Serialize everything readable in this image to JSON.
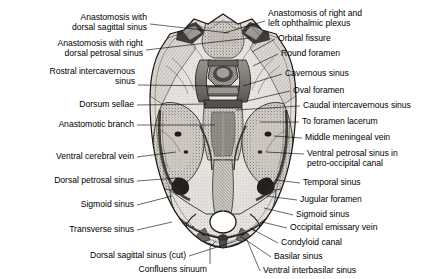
{
  "figure": {
    "illustration_name": "skull-base-venous-sinuses-illustration",
    "style": "grayscale pen-and-ink anatomical drawing",
    "background_color": "#ffffff",
    "ink_color": "#000000",
    "width": 446,
    "height": 279
  },
  "labels_left": [
    {
      "id": "anastomosis-dorsal-sagittal-sinus",
      "lines": [
        "Anastomosis with",
        "dorsal sagittal sinus"
      ],
      "x": 147,
      "y": 12,
      "tip_x": 229,
      "tip_y": 33
    },
    {
      "id": "anastomosis-right-dorsal-petrosal-sinus",
      "lines": [
        "Anastomosis with right",
        "dorsal petrosal sinus"
      ],
      "x": 143,
      "y": 38,
      "tip_x": 250,
      "tip_y": 38
    },
    {
      "id": "rostral-intercavernous-sinus",
      "lines": [
        "Rostral intercavernous",
        "sinus"
      ],
      "x": 135,
      "y": 66,
      "tip_x": 222,
      "tip_y": 86
    },
    {
      "id": "dorsum-sellae",
      "lines": [
        "Dorsum sellae"
      ],
      "x": 134,
      "y": 99,
      "tip_x": 207,
      "tip_y": 104
    },
    {
      "id": "anastomotic-branch",
      "lines": [
        "Anastomotic branch"
      ],
      "x": 134,
      "y": 119,
      "tip_x": 215,
      "tip_y": 125
    },
    {
      "id": "ventral-cerebral-vein",
      "lines": [
        "Ventral cerebral vein"
      ],
      "x": 134,
      "y": 151,
      "tip_x": 176,
      "tip_y": 152
    },
    {
      "id": "dorsal-petrosal-sinus",
      "lines": [
        "Dorsal petrosal sinus"
      ],
      "x": 134,
      "y": 175,
      "tip_x": 178,
      "tip_y": 178
    },
    {
      "id": "sigmoid-sinus-left",
      "lines": [
        "Sigmoid sinus"
      ],
      "x": 134,
      "y": 199,
      "tip_x": 172,
      "tip_y": 196
    },
    {
      "id": "transverse-sinus",
      "lines": [
        "Transverse sinus"
      ],
      "x": 134,
      "y": 224,
      "tip_x": 172,
      "tip_y": 222
    },
    {
      "id": "dorsal-sagittal-sinus-cut",
      "lines": [
        "Dorsal sagittal sinus (cut)"
      ],
      "x": 186,
      "y": 250,
      "tip_x": 236,
      "tip_y": 241
    },
    {
      "id": "confluens-sinuum",
      "lines": [
        "Confluens sinuum"
      ],
      "x": 207,
      "y": 264,
      "tip_x": 211,
      "tip_y": 240
    }
  ],
  "labels_right": [
    {
      "id": "anastomosis-right-left-ophthalmic-plexus",
      "lines": [
        "Anastomosis of right and",
        "left ophthalmic plexus"
      ],
      "x": 268,
      "y": 8,
      "tip_x": 224,
      "tip_y": 33
    },
    {
      "id": "orbital-fissure",
      "lines": [
        "Orbital fissure"
      ],
      "x": 278,
      "y": 33,
      "tip_x": 252,
      "tip_y": 52
    },
    {
      "id": "round-foramen",
      "lines": [
        "Round foramen"
      ],
      "x": 281,
      "y": 48,
      "tip_x": 253,
      "tip_y": 66
    },
    {
      "id": "cavernous-sinus",
      "lines": [
        "Cavernous sinus"
      ],
      "x": 285,
      "y": 68,
      "tip_x": 243,
      "tip_y": 86
    },
    {
      "id": "oval-foramen",
      "lines": [
        "Oval foramen"
      ],
      "x": 293,
      "y": 85,
      "tip_x": 247,
      "tip_y": 101
    },
    {
      "id": "caudal-intercavernous-sinus",
      "lines": [
        "Caudal intercavernous sinus"
      ],
      "x": 303,
      "y": 100,
      "tip_x": 236,
      "tip_y": 110
    },
    {
      "id": "to-foramen-lacerum",
      "lines": [
        "To foramen lacerum"
      ],
      "x": 302,
      "y": 116,
      "tip_x": 260,
      "tip_y": 122
    },
    {
      "id": "middle-meningeal-vein",
      "lines": [
        "Middle meningeal vein"
      ],
      "x": 305,
      "y": 132,
      "tip_x": 274,
      "tip_y": 136
    },
    {
      "id": "ventral-petrosal-sinus",
      "lines": [
        "Ventral petrosal sinus in",
        "petro-occipital canal"
      ],
      "x": 307,
      "y": 148,
      "tip_x": 266,
      "tip_y": 152
    },
    {
      "id": "temporal-sinus",
      "lines": [
        "Temporal sinus"
      ],
      "x": 303,
      "y": 177,
      "tip_x": 276,
      "tip_y": 180
    },
    {
      "id": "jugular-foramen",
      "lines": [
        "Jugular foramen"
      ],
      "x": 300,
      "y": 194,
      "tip_x": 266,
      "tip_y": 196
    },
    {
      "id": "sigmoid-sinus-right",
      "lines": [
        "Sigmoid sinus"
      ],
      "x": 296,
      "y": 209,
      "tip_x": 264,
      "tip_y": 208
    },
    {
      "id": "occipital-emissary-vein",
      "lines": [
        "Occipital emissary vein"
      ],
      "x": 290,
      "y": 222,
      "tip_x": 262,
      "tip_y": 222
    },
    {
      "id": "condyloid-canal",
      "lines": [
        "Condyloid canal"
      ],
      "x": 281,
      "y": 237,
      "tip_x": 250,
      "tip_y": 228
    },
    {
      "id": "basilar-sinus",
      "lines": [
        "Basilar sinus"
      ],
      "x": 274,
      "y": 251,
      "tip_x": 240,
      "tip_y": 236
    },
    {
      "id": "ventral-interbasilar-sinus",
      "lines": [
        "Ventral interbasilar sinus"
      ],
      "x": 263,
      "y": 265,
      "tip_x": 247,
      "tip_y": 240
    }
  ]
}
